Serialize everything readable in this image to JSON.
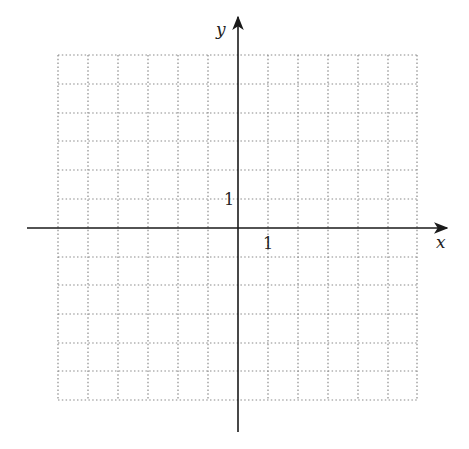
{
  "diagram": {
    "type": "coordinate-plane",
    "axes": {
      "x_label": "x",
      "y_label": "y",
      "x_unit_label": "1",
      "y_unit_label": "1"
    },
    "grid": {
      "columns": 12,
      "rows": 12,
      "style": "dotted",
      "x_range": [
        -6,
        6
      ],
      "y_range": [
        -6,
        6
      ]
    },
    "colors": {
      "axis": "#1a1a1a",
      "grid": "#8a8a8a",
      "background": "#ffffff"
    }
  }
}
